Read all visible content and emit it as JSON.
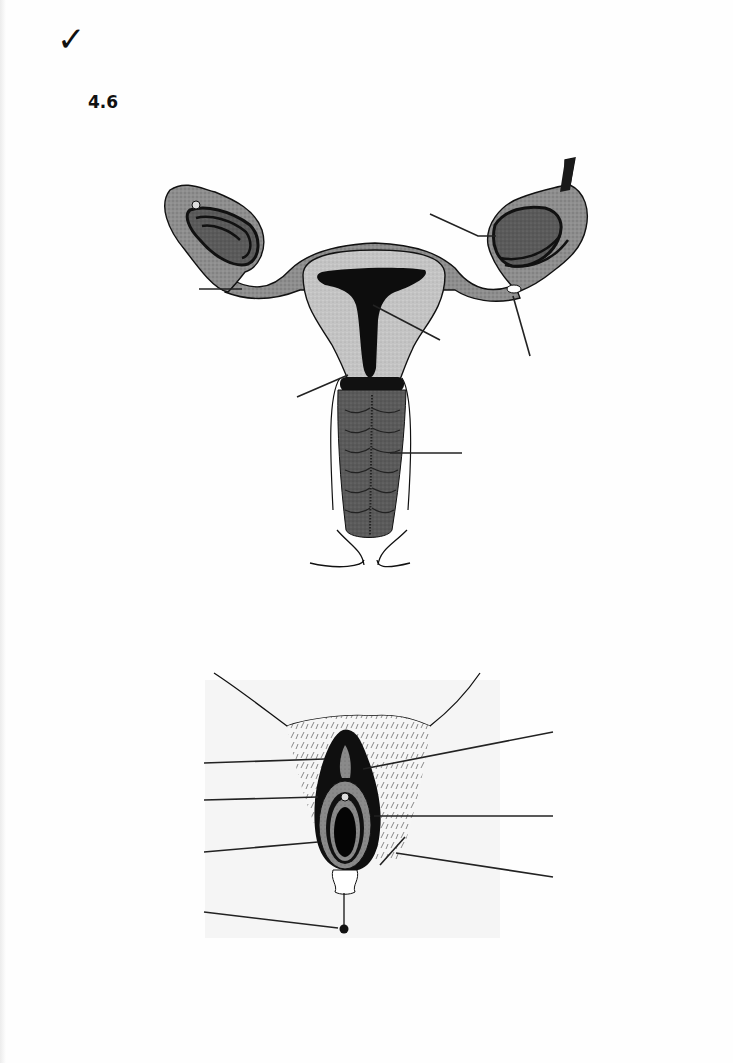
{
  "page": {
    "check_mark": "✓",
    "section_number": "4.6"
  },
  "diagrams": [
    {
      "id": "internal-female-reproductive-organs",
      "label_line_count": 6,
      "labels": [
        "",
        "",
        "",
        "",
        "",
        ""
      ]
    },
    {
      "id": "external-female-genitalia",
      "label_line_count": 8,
      "labels": [
        "",
        "",
        "",
        "",
        "",
        "",
        "",
        ""
      ]
    }
  ],
  "colors": {
    "ink": "#111111",
    "dark_tissue": "#555555",
    "mid_tissue": "#8c8c8c",
    "light_tissue": "#bdbdbd",
    "paper": "#fefefe"
  }
}
